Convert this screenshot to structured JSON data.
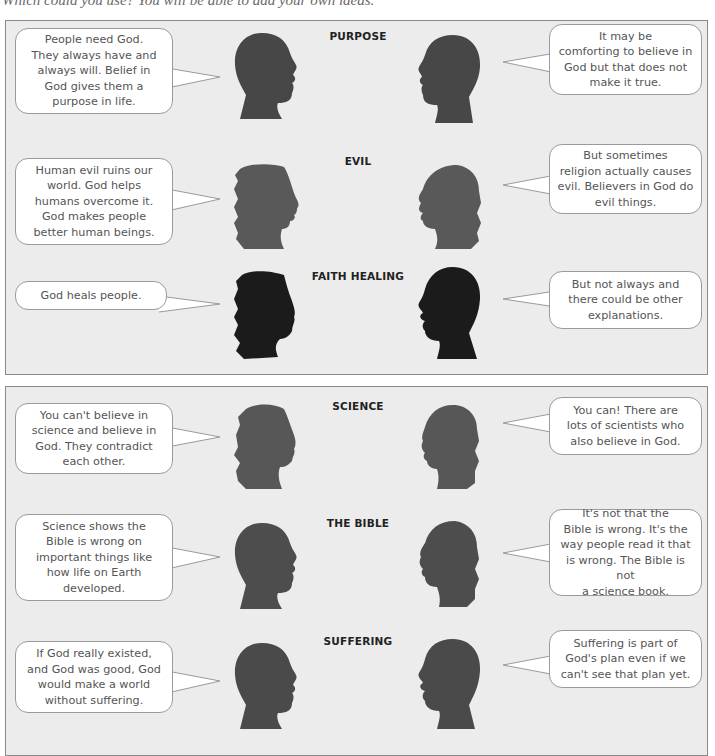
{
  "header": {
    "intro_text": "Which could you use? You will be able to add your own ideas."
  },
  "panels": [
    {
      "rows": [
        {
          "topic": "PURPOSE",
          "left_statement": "People need God.\nThey always have and\nalways will. Belief in\nGod gives them a\npurpose in life.",
          "right_statement": "It may be\ncomforting to believe in\nGod but that does not\nmake it true.",
          "head_color": "#474747"
        },
        {
          "topic": "EVIL",
          "left_statement": "Human evil ruins our\nworld. God helps\nhumans overcome it.\nGod makes people\nbetter human beings.",
          "right_statement": "But sometimes\nreligion actually causes\nevil. Believers in God do\nevil things.",
          "head_color": "#595959"
        },
        {
          "topic": "FAITH HEALING",
          "left_statement": "God heals people.",
          "right_statement": "But not always and\nthere could be other\nexplanations.",
          "head_color": "#1b1b1b"
        }
      ]
    },
    {
      "rows": [
        {
          "topic": "SCIENCE",
          "left_statement": "You can't believe in\nscience and believe in\nGod. They contradict\neach other.",
          "right_statement": "You can! There are\nlots of scientists who\nalso believe in God.",
          "head_color": "#575757"
        },
        {
          "topic": "THE BIBLE",
          "left_statement": "Science shows the\nBible is wrong on\nimportant things like\nhow life on Earth\ndeveloped.",
          "right_statement": "It's not that the\nBible is wrong. It's the\nway people read it that\nis wrong. The Bible is not\na science book.",
          "head_color": "#4d4d4d"
        },
        {
          "topic": "SUFFERING",
          "left_statement": "If God really existed,\nand God was good, God\nwould make a world\nwithout suffering.",
          "right_statement": "Suffering is part of\nGod's plan even if we\ncan't see that plan yet.",
          "head_color": "#4a4a4a"
        }
      ]
    }
  ],
  "colors": {
    "panel_bg": "#ececec",
    "panel_border": "#8a8a8a",
    "bubble_bg": "#ffffff",
    "bubble_border": "#9a9a9a",
    "bubble_text": "#555555",
    "topic_text": "#222222"
  }
}
